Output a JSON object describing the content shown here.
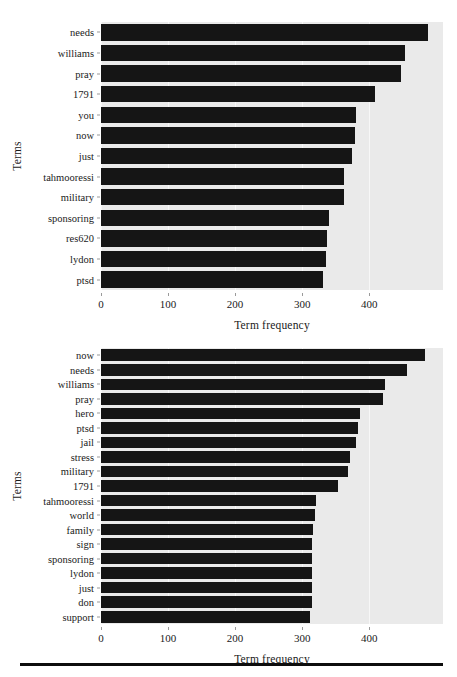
{
  "page": {
    "background_color": "#ffffff",
    "bar_color": "#151515",
    "panel_color": "#eaeaea",
    "grid_color": "#f7f7f7",
    "footer_rule": true
  },
  "chart_data": [
    {
      "id": "chart-top",
      "type": "bar",
      "orientation": "horizontal",
      "title": "",
      "xlabel": "Term frequency",
      "ylabel": "Terms",
      "xlim": [
        0,
        510
      ],
      "xticks": [
        0,
        100,
        200,
        300,
        400
      ],
      "xticklabels": [
        "0",
        "100",
        "200",
        "300",
        "400"
      ],
      "grid": true,
      "grid_axis": "x",
      "legend": false,
      "categories": [
        "needs",
        "williams",
        "pray",
        "1791",
        "you",
        "now",
        "just",
        "tahmooressi",
        "military",
        "sponsoring",
        "res620",
        "lydon",
        "ptsd"
      ],
      "values": [
        487,
        453,
        447,
        408,
        381,
        379,
        375,
        363,
        362,
        340,
        337,
        335,
        331
      ]
    },
    {
      "id": "chart-bottom",
      "type": "bar",
      "orientation": "horizontal",
      "title": "",
      "xlabel": "Term frequency",
      "ylabel": "Terms",
      "xlim": [
        0,
        510
      ],
      "xticks": [
        0,
        100,
        200,
        300,
        400
      ],
      "xticklabels": [
        "0",
        "100",
        "200",
        "300",
        "400"
      ],
      "grid": true,
      "grid_axis": "x",
      "legend": false,
      "categories": [
        "now",
        "needs",
        "williams",
        "pray",
        "hero",
        "ptsd",
        "jail",
        "stress",
        "military",
        "1791",
        "tahmooressi",
        "world",
        "family",
        "sign",
        "sponsoring",
        "lydon",
        "just",
        "don",
        "support"
      ],
      "values": [
        483,
        456,
        423,
        420,
        386,
        383,
        381,
        372,
        368,
        353,
        320,
        319,
        316,
        315,
        314,
        314,
        314,
        314,
        311
      ]
    }
  ]
}
